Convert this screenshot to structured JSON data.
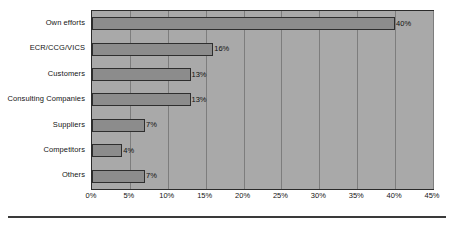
{
  "chart_data": {
    "type": "bar",
    "orientation": "horizontal",
    "title": "",
    "xlabel": "",
    "ylabel": "",
    "categories": [
      "Own efforts",
      "ECR/CCG/VICS",
      "Customers",
      "Consulting Companies",
      "Suppliers",
      "Competitors",
      "Others"
    ],
    "values": [
      40,
      16,
      13,
      13,
      7,
      4,
      7
    ],
    "value_labels": [
      "40%",
      "16%",
      "13%",
      "13%",
      "7%",
      "4%",
      "7%"
    ],
    "xlim": [
      0,
      45
    ],
    "xticks": [
      0,
      5,
      10,
      15,
      20,
      25,
      30,
      35,
      40,
      45
    ],
    "xtick_labels": [
      "0%",
      "5%",
      "10%",
      "15%",
      "20%",
      "25%",
      "30%",
      "35%",
      "40%",
      "45%"
    ],
    "grid": true,
    "grid_axis": "x",
    "legend": false,
    "colors": {
      "bar_fill": "#8c8c8c",
      "bar_border": "#2e2e2e",
      "plot_background": "#a9a9a9",
      "plot_border": "#2b2b2b",
      "gridline": "#7d7d7d",
      "text": "#141414",
      "page_background": "#ffffff",
      "rule": "#3a3a3a"
    }
  }
}
